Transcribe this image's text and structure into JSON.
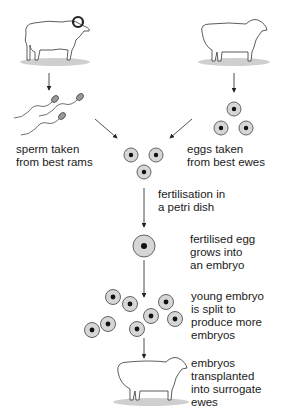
{
  "diagram": {
    "labels": {
      "sperm": [
        "sperm taken",
        "from best rams"
      ],
      "eggs": [
        "eggs taken",
        "from best ewes"
      ],
      "fertilisation": [
        "fertilisation in",
        "a petri dish"
      ],
      "embryo": [
        "fertilised egg",
        "grows into",
        "an embryo"
      ],
      "split": [
        "young embryo",
        "is split to",
        "produce more",
        "embryos"
      ],
      "transplant": [
        "embryos",
        "transplanted",
        "into surrogate",
        "ewes"
      ]
    },
    "counts": {
      "egg_cells": 3,
      "fertilisation_cells": 3,
      "embryo_cells": 1,
      "split_embryos": 8,
      "sperm_cells": 3
    },
    "colors": {
      "cell_fill": "#d6d6d6",
      "cell_outline": "#555555",
      "nucleus": "#111111",
      "line": "#222222",
      "shadow": "#cfcfcf"
    }
  }
}
